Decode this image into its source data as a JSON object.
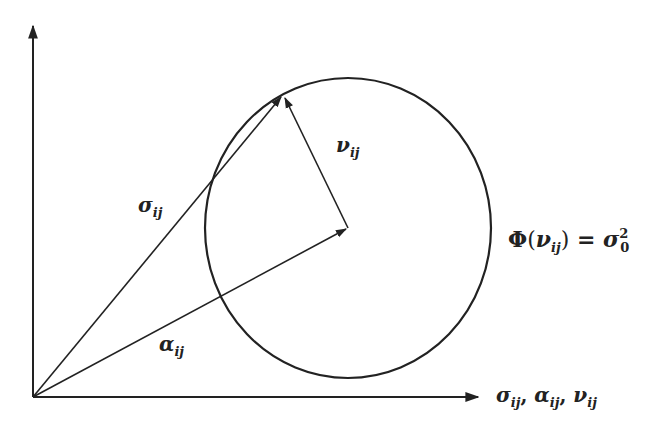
{
  "diagram": {
    "type": "vector-geometry",
    "colors": {
      "background": "#ffffff",
      "ink": "#222222"
    },
    "origin": {
      "x": 33,
      "y": 397
    },
    "axes": {
      "vertical": {
        "from": [
          33,
          397
        ],
        "to": [
          33,
          26
        ]
      },
      "horizontal": {
        "from": [
          33,
          397
        ],
        "to": [
          478,
          397
        ]
      },
      "horizontal_label": {
        "parts": [
          {
            "base": "σ",
            "sub": "ij"
          },
          {
            "sep": ", "
          },
          {
            "base": "α",
            "sub": "ij"
          },
          {
            "sep": ", "
          },
          {
            "base": "ν",
            "sub": "ij"
          }
        ],
        "text": "σ_ij, α_ij, ν_ij"
      }
    },
    "circle": {
      "center": [
        348,
        228
      ],
      "rx": 143,
      "ry": 150,
      "label": {
        "text": "Φ(ν_ij) = σ_0^2",
        "lhs_func": "Φ",
        "lhs_open": "(",
        "lhs_base": "ν",
        "lhs_sub": "ij",
        "lhs_close": ")",
        "equals": " = ",
        "rhs_base": "σ",
        "rhs_sub": "0",
        "rhs_sup": "2"
      }
    },
    "vectors": [
      {
        "name": "sigma",
        "from": [
          33,
          397
        ],
        "to": [
          283,
          95
        ],
        "label_base": "σ",
        "label_sub": "ij"
      },
      {
        "name": "alpha",
        "from": [
          33,
          397
        ],
        "to": [
          348,
          228
        ],
        "label_base": "α",
        "label_sub": "ij"
      },
      {
        "name": "nu",
        "from": [
          348,
          228
        ],
        "to": [
          283,
          95
        ],
        "label_base": "ν",
        "label_sub": "ij"
      }
    ]
  }
}
